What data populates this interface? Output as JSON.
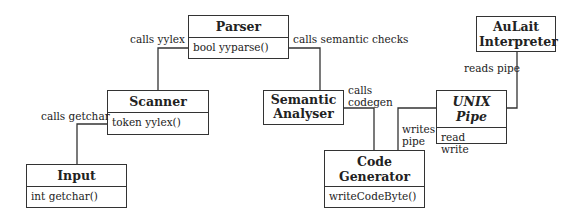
{
  "diagram": {
    "classes": {
      "parser": {
        "name": "Parser",
        "ops": [
          "bool yyparse()"
        ]
      },
      "scanner": {
        "name": "Scanner",
        "ops": [
          "token yylex()"
        ]
      },
      "input": {
        "name": "Input",
        "ops": [
          "int getchar()"
        ]
      },
      "semantic": {
        "name_line1": "Semantic",
        "name_line2": "Analyser"
      },
      "codegen": {
        "name_line1": "Code",
        "name_line2": "Generator",
        "ops": [
          "writeCodeByte()"
        ]
      },
      "pipe": {
        "name": "UNIX Pipe",
        "ops": [
          "read",
          "write"
        ]
      },
      "aulait": {
        "name_line1": "AuLait",
        "name_line2": "Interpreter"
      }
    },
    "labels": {
      "calls_yylex": "calls yylex",
      "calls_semantic": "calls semantic checks",
      "calls_getchar": "calls getchar",
      "calls_codegen_1": "calls",
      "calls_codegen_2": "codegen",
      "writes_pipe_1": "writes",
      "writes_pipe_2": "pipe",
      "reads_pipe": "reads pipe"
    }
  }
}
